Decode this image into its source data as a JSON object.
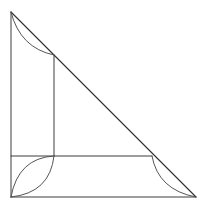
{
  "figure": {
    "title": "Right triangle with inscribed rectangle and corner arcs",
    "background_color": "#ffffff",
    "line_color": "#3c3c3c",
    "arc_color": "#555555",
    "hypotenuse_color": "#2e2e2e",
    "canvas": {
      "width": 203,
      "height": 210
    },
    "vertices": {
      "apex": {
        "label": "A",
        "x": 11,
        "y": 12
      },
      "bottom_left": {
        "label": "B",
        "x": 11,
        "y": 197
      },
      "bottom_right": {
        "label": "C",
        "x": 196,
        "y": 197
      }
    },
    "interior_points": {
      "upper_on_hypotenuse": {
        "label": "D",
        "x": 54,
        "y": 55
      },
      "inner_corner": {
        "label": "E",
        "x": 54,
        "y": 156
      },
      "lower_on_hypotenuse": {
        "label": "F",
        "x": 152,
        "y": 156
      }
    },
    "segments": [
      {
        "name": "left-leg",
        "from": "apex",
        "to": "bottom_left",
        "x1": 11,
        "y1": 12,
        "x2": 11,
        "y2": 197
      },
      {
        "name": "bottom-leg",
        "from": "bottom_left",
        "to": "bottom_right",
        "x1": 11,
        "y1": 197,
        "x2": 196,
        "y2": 197
      },
      {
        "name": "hypotenuse",
        "from": "apex",
        "to": "bottom_right",
        "x1": 11,
        "y1": 12,
        "x2": 196,
        "y2": 197
      },
      {
        "name": "inner-vertical",
        "from": "upper_on_hypotenuse",
        "to": "inner_corner",
        "x1": 54,
        "y1": 55,
        "x2": 54,
        "y2": 156
      },
      {
        "name": "inner-horizontal",
        "from": "bottom_left_side",
        "to": "lower_on_hypotenuse",
        "x1": 11,
        "y1": 156,
        "x2": 152,
        "y2": 156
      }
    ],
    "arcs": [
      {
        "name": "top-left-arc",
        "from": "apex",
        "to": "upper_on_hypotenuse",
        "path": "M 11 12 Q 20 48 54 55",
        "description": "arc bowing toward lower-left from apex to hypotenuse point"
      },
      {
        "name": "bottom-left-arc-upper",
        "from": "bottom_left",
        "to": "inner_corner",
        "path": "M 11 197 Q 18 158 54 156",
        "description": "upper arc of the lens shape at bottom-left corner"
      },
      {
        "name": "bottom-left-arc-lower",
        "from": "bottom_left",
        "to": "inner_corner",
        "path": "M 11 197 Q 50 193 54 156",
        "description": "lower arc of the lens shape at bottom-left corner"
      },
      {
        "name": "bottom-right-arc",
        "from": "lower_on_hypotenuse",
        "to": "bottom_right",
        "path": "M 152 156 Q 158 190 196 197",
        "description": "arc bowing toward lower-left from hypotenuse point to right vertex"
      }
    ]
  }
}
